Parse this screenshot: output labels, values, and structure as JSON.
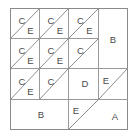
{
  "figure": {
    "background_color": "#ffffff",
    "line_color": "#9a9a9a",
    "label_color": "#4a4a4a",
    "frame": {
      "x": 10,
      "y": 8,
      "width": 118,
      "height": 122
    },
    "grid": {
      "columns": 4,
      "rows": 4,
      "cell_width": 29.5,
      "cell_height": 30.5
    }
  },
  "regions": [
    {
      "id": "r1c1-C",
      "label": "C",
      "shape": "triangle-upper-left",
      "x": 22,
      "y": 20
    },
    {
      "id": "r1c1-E",
      "label": "E",
      "shape": "triangle-lower-right",
      "x": 50,
      "y": 50
    },
    {
      "id": "r1c2-C",
      "label": "C",
      "shape": "triangle-upper-left",
      "x": 51,
      "y": 20
    },
    {
      "id": "r1c2-E",
      "label": "E",
      "shape": "triangle-lower-right",
      "x": 79,
      "y": 50
    },
    {
      "id": "r1c3-C",
      "label": "C",
      "shape": "triangle-upper-left",
      "x": 81,
      "y": 20
    },
    {
      "id": "r1c3-E",
      "label": "E",
      "shape": "triangle-lower-right",
      "x": 108,
      "y": 50
    },
    {
      "id": "r2c1-C",
      "label": "C",
      "shape": "triangle-upper-left",
      "x": 22,
      "y": 51
    },
    {
      "id": "r2c1-E",
      "label": "E",
      "shape": "triangle-lower-right",
      "x": 50,
      "y": 80
    },
    {
      "id": "r2c2-C",
      "label": "C",
      "shape": "triangle-upper-left",
      "x": 51,
      "y": 51
    },
    {
      "id": "r2c2-E",
      "label": "E",
      "shape": "triangle-lower-right",
      "x": 79,
      "y": 80
    },
    {
      "id": "r2c3-C",
      "label": "C",
      "shape": "triangle-upper-left",
      "x": 81,
      "y": 51
    },
    {
      "id": "r3c1-C",
      "label": "C",
      "shape": "triangle-upper-left",
      "x": 22,
      "y": 81
    },
    {
      "id": "r3c1-E",
      "label": "E",
      "shape": "triangle-lower-right",
      "x": 50,
      "y": 110
    },
    {
      "id": "r3c2-C",
      "label": "C",
      "shape": "triangle-upper-left",
      "x": 51,
      "y": 81
    },
    {
      "id": "region-B-right",
      "label": "B",
      "shape": "rectangle",
      "x": 113,
      "y": 58
    },
    {
      "id": "region-D",
      "label": "D",
      "shape": "polygon",
      "x": 92,
      "y": 88
    },
    {
      "id": "region-E-right",
      "label": "E",
      "shape": "triangle-upper-left",
      "x": 115,
      "y": 87
    },
    {
      "id": "region-B-bottom",
      "label": "B",
      "shape": "rectangle",
      "x": 46,
      "y": 115
    },
    {
      "id": "region-E-bottom",
      "label": "E",
      "shape": "triangle-upper-left",
      "x": 82,
      "y": 113
    },
    {
      "id": "region-A",
      "label": "A",
      "shape": "triangle-lower-right",
      "x": 116,
      "y": 117
    }
  ],
  "legend_pieces": [
    "A",
    "B",
    "C",
    "D",
    "E"
  ]
}
